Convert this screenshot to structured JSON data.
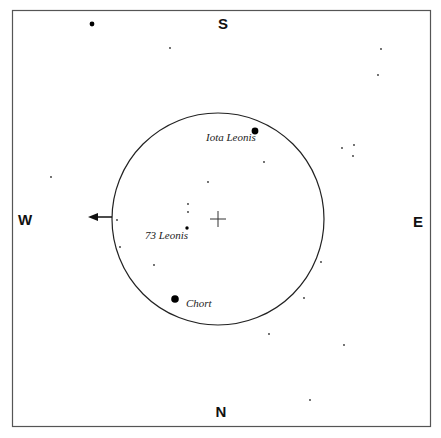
{
  "chart_title": "Finder chart",
  "directions": {
    "top": "S",
    "bottom": "N",
    "left": "W",
    "right": "E"
  },
  "colors": {
    "ink": "#111111",
    "frame": "#555555",
    "background": "#ffffff"
  },
  "field_of_view": {
    "center_marker": "crosshair",
    "motion_arrow_direction": "W"
  },
  "labeled_stars": [
    {
      "name": "Iota Leonis",
      "size": "large"
    },
    {
      "name": "73 Leonis",
      "size": "medium"
    },
    {
      "name": "Chort",
      "size": "large"
    }
  ],
  "stars": [
    {
      "x": 92,
      "y": 24,
      "mag": "bright"
    },
    {
      "x": 170,
      "y": 48,
      "mag": "faint"
    },
    {
      "x": 381,
      "y": 49,
      "mag": "faint"
    },
    {
      "x": 378,
      "y": 75,
      "mag": "faint"
    },
    {
      "x": 342,
      "y": 148,
      "mag": "faint"
    },
    {
      "x": 354,
      "y": 145,
      "mag": "faint"
    },
    {
      "x": 353,
      "y": 156,
      "mag": "faint"
    },
    {
      "x": 264,
      "y": 162,
      "mag": "faint"
    },
    {
      "x": 51,
      "y": 177,
      "mag": "faint"
    },
    {
      "x": 208,
      "y": 182,
      "mag": "faint"
    },
    {
      "x": 188,
      "y": 204,
      "mag": "faint"
    },
    {
      "x": 188,
      "y": 212,
      "mag": "faint"
    },
    {
      "x": 117,
      "y": 220,
      "mag": "faint"
    },
    {
      "x": 120,
      "y": 247,
      "mag": "faint"
    },
    {
      "x": 154,
      "y": 265,
      "mag": "faint"
    },
    {
      "x": 321,
      "y": 262,
      "mag": "faint"
    },
    {
      "x": 304,
      "y": 298,
      "mag": "faint"
    },
    {
      "x": 269,
      "y": 334,
      "mag": "faint"
    },
    {
      "x": 344,
      "y": 345,
      "mag": "faint"
    },
    {
      "x": 310,
      "y": 400,
      "mag": "faint"
    }
  ]
}
